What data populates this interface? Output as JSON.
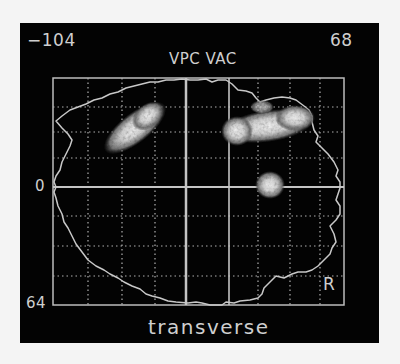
{
  "figure": {
    "corner_left_label": "−104",
    "corner_right_label": "68",
    "reference_title": "VPC VAC",
    "y_label_center": "0",
    "y_label_bottom": "64",
    "side_marker": "R",
    "view_label": "transverse"
  },
  "colors": {
    "background": "#030303",
    "grid": "#bdbdbd",
    "outline": "#c8c8c8",
    "activation_core": "#f2f2f2",
    "activation_edge": "#6a6a6a"
  },
  "grid": {
    "plot_box": {
      "x": 53,
      "y": 78,
      "w": 291,
      "h": 227
    },
    "solid_vertical_lines_x": [
      186,
      229
    ],
    "solid_horizontal_line_y": 187,
    "dotted_vertical_lines_x": [
      88,
      122,
      155,
      258,
      290,
      320
    ],
    "dotted_horizontal_lines_y": [
      107,
      132,
      158,
      216,
      246,
      276
    ]
  },
  "activations": [
    {
      "name": "left-frontal-blob",
      "cx": 135,
      "cy": 128,
      "rx": 36,
      "ry": 14,
      "rotate": -38
    },
    {
      "name": "right-frontal-blob",
      "cx": 268,
      "cy": 126,
      "rx": 44,
      "ry": 15,
      "rotate": -8
    },
    {
      "name": "right-central-blob",
      "cx": 270,
      "cy": 185,
      "rx": 14,
      "ry": 13,
      "rotate": 0
    }
  ]
}
